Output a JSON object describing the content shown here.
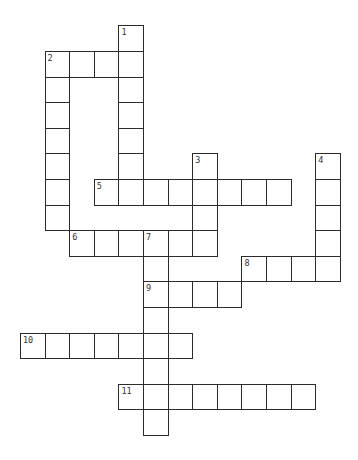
{
  "puzzle": {
    "type": "crossword",
    "grid": {
      "origin_x": 20,
      "origin_y": 25.4,
      "cell_w": 24.6,
      "cell_h": 25.6,
      "cols": 13,
      "rows": 16
    },
    "colors": {
      "line": "#2b2b2b",
      "cell_bg": "#ffffff",
      "number": "#333333"
    },
    "entries": [
      {
        "number": "1",
        "direction": "down",
        "row": 0,
        "col": 4,
        "length": 7
      },
      {
        "number": "2",
        "direction": "across",
        "row": 1,
        "col": 1,
        "length": 4
      },
      {
        "number": "2",
        "direction": "down",
        "row": 1,
        "col": 1,
        "length": 7
      },
      {
        "number": "3",
        "direction": "down",
        "row": 5,
        "col": 7,
        "length": 4
      },
      {
        "number": "4",
        "direction": "down",
        "row": 5,
        "col": 12,
        "length": 5
      },
      {
        "number": "5",
        "direction": "across",
        "row": 6,
        "col": 3,
        "length": 8
      },
      {
        "number": "6",
        "direction": "across",
        "row": 8,
        "col": 2,
        "length": 6
      },
      {
        "number": "7",
        "direction": "down",
        "row": 8,
        "col": 5,
        "length": 8
      },
      {
        "number": "8",
        "direction": "across",
        "row": 9,
        "col": 9,
        "length": 4
      },
      {
        "number": "9",
        "direction": "across",
        "row": 10,
        "col": 5,
        "length": 4
      },
      {
        "number": "10",
        "direction": "across",
        "row": 12,
        "col": 0,
        "length": 7
      },
      {
        "number": "11",
        "direction": "across",
        "row": 14,
        "col": 4,
        "length": 8
      }
    ]
  }
}
